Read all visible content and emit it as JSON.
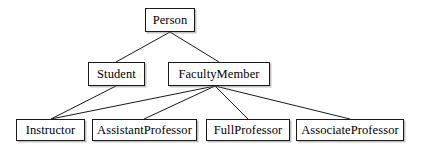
{
  "diagram": {
    "type": "class-hierarchy",
    "canvas": {
      "width": 421,
      "height": 147
    },
    "style": {
      "background_color": "#ffffff",
      "box_fill": "#ffffff",
      "box_border_color": "#1a1a1a",
      "edge_color": "#1a1a1a",
      "text_color": "#000000",
      "shadow_color": "#787878"
    },
    "nodes": [
      {
        "id": "person",
        "label": "Person",
        "x": 145,
        "y": 8,
        "width": 50,
        "height": 24,
        "level": 0
      },
      {
        "id": "student",
        "label": "Student",
        "x": 88,
        "y": 62,
        "width": 57,
        "height": 24,
        "level": 1
      },
      {
        "id": "facultymember",
        "label": "FacultyMember",
        "x": 168,
        "y": 62,
        "width": 102,
        "height": 24,
        "level": 1
      },
      {
        "id": "instructor",
        "label": "Instructor",
        "x": 16,
        "y": 119,
        "width": 69,
        "height": 22,
        "level": 2
      },
      {
        "id": "assistantprofessor",
        "label": "AssistantProfessor",
        "x": 92,
        "y": 119,
        "width": 105,
        "height": 22,
        "level": 2
      },
      {
        "id": "fullprofessor",
        "label": "FullProfessor",
        "x": 206,
        "y": 119,
        "width": 84,
        "height": 22,
        "level": 2
      },
      {
        "id": "associateprofessor",
        "label": "AssociateProfessor",
        "x": 296,
        "y": 119,
        "width": 108,
        "height": 22,
        "level": 2
      }
    ],
    "edges": [
      {
        "id": "e-person-student",
        "from": "person",
        "to": "student",
        "x1": 170,
        "y1": 32,
        "x2": 116,
        "y2": 62
      },
      {
        "id": "e-person-facultymember",
        "from": "person",
        "to": "facultymember",
        "x1": 170,
        "y1": 32,
        "x2": 219,
        "y2": 62
      },
      {
        "id": "e-student-instructor",
        "from": "student",
        "to": "instructor",
        "x1": 116,
        "y1": 86,
        "x2": 51,
        "y2": 119
      },
      {
        "id": "e-faculty-instructor",
        "from": "facultymember",
        "to": "instructor",
        "x1": 215,
        "y1": 86,
        "x2": 51,
        "y2": 119
      },
      {
        "id": "e-faculty-assistant",
        "from": "facultymember",
        "to": "assistantprofessor",
        "x1": 215,
        "y1": 86,
        "x2": 144,
        "y2": 119
      },
      {
        "id": "e-faculty-full",
        "from": "facultymember",
        "to": "fullprofessor",
        "x1": 215,
        "y1": 86,
        "x2": 248,
        "y2": 119
      },
      {
        "id": "e-faculty-associate",
        "from": "facultymember",
        "to": "associateprofessor",
        "x1": 215,
        "y1": 86,
        "x2": 350,
        "y2": 119
      }
    ]
  }
}
